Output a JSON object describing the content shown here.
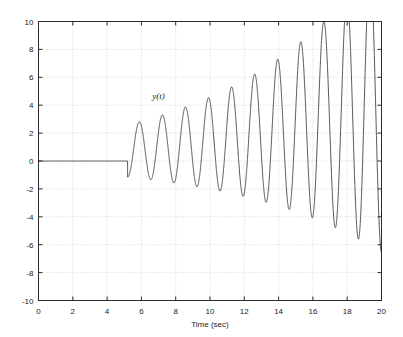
{
  "chart_data": {
    "type": "line",
    "title": "",
    "xlabel": "Time (sec)",
    "ylabel": "",
    "xlim": [
      0,
      20
    ],
    "ylim": [
      -10,
      10
    ],
    "xticks": [
      0,
      2,
      4,
      6,
      8,
      10,
      12,
      14,
      16,
      18,
      20
    ],
    "xtick_labels": [
      "0",
      "2",
      "4",
      "6",
      "8",
      "10",
      "12",
      "14",
      "16",
      "18",
      "20"
    ],
    "yticks": [
      -10,
      -8,
      -6,
      -4,
      -2,
      0,
      2,
      4,
      6,
      8,
      10
    ],
    "ytick_labels": [
      "-10",
      "-8",
      "-6",
      "-4",
      "-2",
      "0",
      "2",
      "4",
      "6",
      "8",
      "10"
    ],
    "grid": true,
    "grid_style": "dotted",
    "legend": null,
    "legend_position": "none",
    "line_color": "#2b2b2b",
    "line_width": 0.8,
    "annotations": [
      {
        "text": "y(t)",
        "x": 7.0,
        "y": 4.45,
        "style": "italic"
      }
    ],
    "series": [
      {
        "name": "y(t)",
        "description": "Zero until t = 5.2 s, then an exponentially growing sinusoid that is clipped by the axis limits beyond t = 17.2 s",
        "model": {
          "start_time": 5.2,
          "zero_before_start": true,
          "amplitude_initial": 2.6,
          "growth_rate": 0.118,
          "period": 1.345,
          "phase_deg": -90
        },
        "peaks": [
          {
            "t": 5.6,
            "y": 3.0
          },
          {
            "t": 6.95,
            "y": 3.2
          },
          {
            "t": 8.0,
            "y": 3.6
          },
          {
            "t": 9.2,
            "y": 4.1
          },
          {
            "t": 10.4,
            "y": 4.75
          },
          {
            "t": 11.55,
            "y": 5.4
          },
          {
            "t": 12.75,
            "y": 6.2
          },
          {
            "t": 13.95,
            "y": 7.1
          },
          {
            "t": 15.1,
            "y": 8.15
          },
          {
            "t": 16.3,
            "y": 9.45
          },
          {
            "t": 17.5,
            "y": 10.0
          },
          {
            "t": 18.7,
            "y": 10.0
          },
          {
            "t": 19.9,
            "y": 10.0
          }
        ],
        "troughs": [
          {
            "t": 6.35,
            "y": -1.05
          },
          {
            "t": 7.5,
            "y": -1.45
          },
          {
            "t": 8.65,
            "y": -1.85
          },
          {
            "t": 9.8,
            "y": -2.35
          },
          {
            "t": 11.0,
            "y": -2.95
          },
          {
            "t": 12.2,
            "y": -3.7
          },
          {
            "t": 13.35,
            "y": -4.5
          },
          {
            "t": 14.5,
            "y": -5.55
          },
          {
            "t": 15.7,
            "y": -6.75
          },
          {
            "t": 16.85,
            "y": -8.2
          },
          {
            "t": 18.0,
            "y": -10.0
          },
          {
            "t": 19.2,
            "y": -10.0
          }
        ]
      }
    ]
  },
  "axes": {
    "box_color": "#2b2b2b",
    "grid_color": "#aaaaaa",
    "background": "#ffffff"
  }
}
